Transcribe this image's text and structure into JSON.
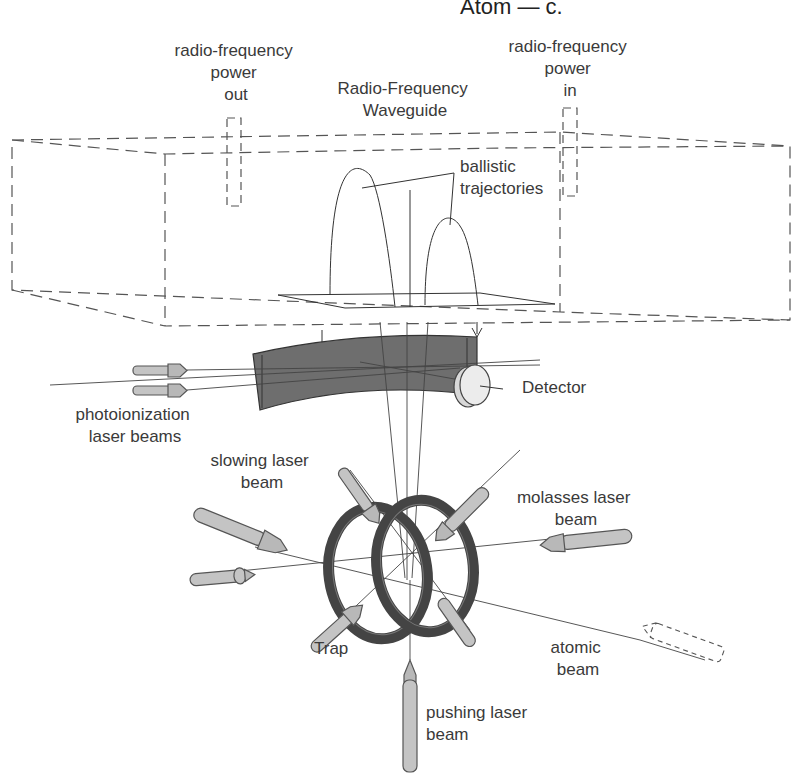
{
  "figure": {
    "header_partial": "Atom — c.",
    "labels": {
      "rf_power_out": [
        "radio-frequency",
        "power",
        "out"
      ],
      "rf_power_in": [
        "radio-frequency",
        "power",
        "in"
      ],
      "waveguide": [
        "Radio-Frequency",
        "Waveguide"
      ],
      "ballistic": [
        "ballistic",
        "trajectories"
      ],
      "detector": "Detector",
      "photoionization": [
        "photoionization",
        "laser beams"
      ],
      "slowing": [
        "slowing laser",
        "beam"
      ],
      "molasses": [
        "molasses laser",
        "beam"
      ],
      "trap": "Trap",
      "atomic_beam": [
        "atomic",
        "beam"
      ],
      "pushing": [
        "pushing laser",
        "beam"
      ]
    },
    "colors": {
      "line": "#333333",
      "detector_plate": "#6e6e6e",
      "laser_body": "#c4c4c4",
      "ring": "#444444",
      "detector_disk": "#e6e6e6"
    }
  }
}
